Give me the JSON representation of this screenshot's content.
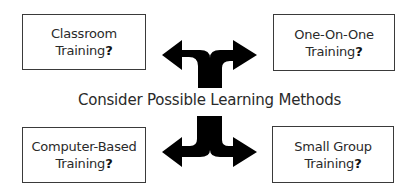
{
  "diagram": {
    "center_label": "Consider Possible Learning Methods",
    "options": [
      {
        "position": "top-left",
        "line1": "Classroom",
        "line2": "Training",
        "mark": "?"
      },
      {
        "position": "top-right",
        "line1": "One-On-One",
        "line2": "Training",
        "mark": "?"
      },
      {
        "position": "bottom-left",
        "line1": "Computer-Based",
        "line2": "Training",
        "mark": "?"
      },
      {
        "position": "bottom-right",
        "line1": "Small Group",
        "line2": "Training",
        "mark": "?"
      }
    ],
    "arrows": [
      {
        "name": "upper-fork-arrow",
        "directions": [
          "left",
          "right"
        ],
        "color": "#000000"
      },
      {
        "name": "lower-fork-arrow",
        "directions": [
          "left",
          "right"
        ],
        "color": "#000000"
      }
    ],
    "colors": {
      "box_border": "#3a3a3a",
      "text": "#2a2a2a",
      "arrow": "#000000",
      "background": "#ffffff"
    }
  }
}
